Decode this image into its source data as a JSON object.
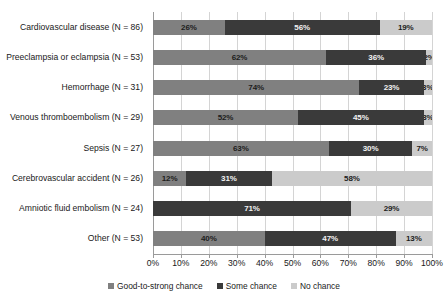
{
  "chart_data": {
    "type": "bar",
    "subtype": "stacked-horizontal-100",
    "title": "",
    "xlabel": "",
    "ylabel": "",
    "xlim": [
      0,
      100
    ],
    "xticks": [
      "0%",
      "10%",
      "20%",
      "30%",
      "40%",
      "50%",
      "60%",
      "70%",
      "80%",
      "90%",
      "100%"
    ],
    "xtick_values": [
      0,
      10,
      20,
      30,
      40,
      50,
      60,
      70,
      80,
      90,
      100
    ],
    "grid": true,
    "legend_position": "bottom",
    "categories": [
      "Cardiovascular disease (N = 86)",
      "Preeclampsia or eclampsia (N = 53)",
      "Hemorrhage (N = 31)",
      "Venous thromboembolism (N = 29)",
      "Sepsis (N = 27)",
      "Cerebrovascular accident (N = 26)",
      "Amniotic fluid embolism (N = 24)",
      "Other (N = 53)"
    ],
    "series": [
      {
        "name": "Good-to-strong chance",
        "color": "#808080",
        "values": [
          26,
          62,
          74,
          52,
          63,
          12,
          0,
          40
        ],
        "labels": [
          "26%",
          "62%",
          "74%",
          "52%",
          "63%",
          "12%",
          "",
          "40%"
        ]
      },
      {
        "name": "Some chance",
        "color": "#3a3a3a",
        "values": [
          56,
          36,
          23,
          45,
          30,
          31,
          71,
          47
        ],
        "labels": [
          "56%",
          "36%",
          "23%",
          "45%",
          "30%",
          "31%",
          "71%",
          "47%"
        ]
      },
      {
        "name": "No chance",
        "color": "#cbcbcb",
        "values": [
          19,
          2,
          3,
          3,
          7,
          58,
          29,
          13
        ],
        "labels": [
          "19%",
          "2%",
          "3%",
          "3%",
          "7%",
          "58%",
          "29%",
          "13%"
        ]
      }
    ]
  },
  "legend": {
    "items": [
      {
        "label": "Good-to-strong chance",
        "color": "#808080"
      },
      {
        "label": "Some chance",
        "color": "#3a3a3a"
      },
      {
        "label": "No chance",
        "color": "#cbcbcb"
      }
    ]
  }
}
